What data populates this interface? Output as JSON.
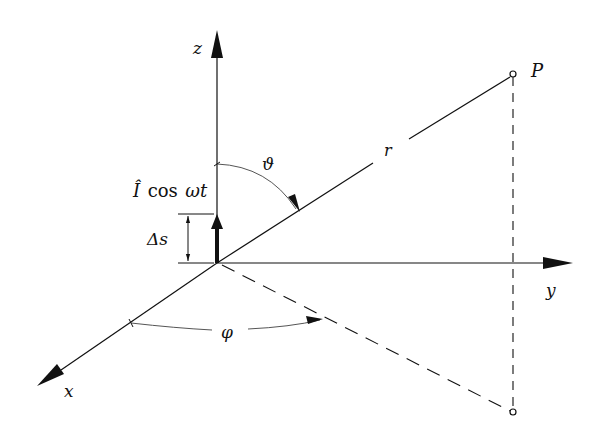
{
  "diagram": {
    "colors": {
      "line": "#111111",
      "background": "#ffffff",
      "arc": "#555555"
    },
    "labels": {
      "z_axis": "z",
      "y_axis": "y",
      "x_axis": "x",
      "point": "P",
      "radius": "r",
      "theta": "ϑ",
      "phi": "φ",
      "current_I": "Î",
      "current_cos": "cos",
      "current_omega_t": "ωt",
      "delta_s": "Δs"
    }
  }
}
